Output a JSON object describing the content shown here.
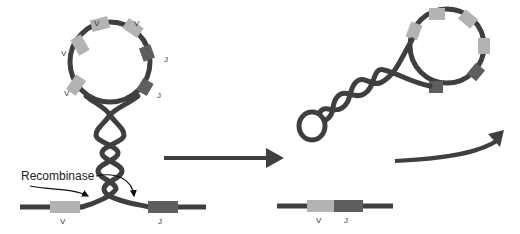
{
  "diagram": {
    "colors": {
      "dna": "#3f3f3f",
      "v_segment": "#b3b3b3",
      "j_segment": "#5e5e5e",
      "arrow": "#3f3f3f",
      "background": "#ffffff"
    },
    "left_panel": {
      "loop_segments": [
        {
          "type": "V",
          "label": "V"
        },
        {
          "type": "V",
          "label": "V"
        },
        {
          "type": "V",
          "label": "V"
        },
        {
          "type": "V",
          "label": "V"
        },
        {
          "type": "J",
          "label": "J"
        },
        {
          "type": "J",
          "label": "J"
        }
      ],
      "enzyme_label": "Recombinase",
      "bottom_segments": [
        {
          "type": "V",
          "label": "V"
        },
        {
          "type": "J",
          "label": "J"
        }
      ]
    },
    "transition_arrow": {
      "direction": "right"
    },
    "right_panel": {
      "excised_loop_segments": [
        {
          "type": "V"
        },
        {
          "type": "V"
        },
        {
          "type": "V"
        },
        {
          "type": "V"
        },
        {
          "type": "J"
        },
        {
          "type": "J"
        }
      ],
      "curved_arrow": {
        "direction": "up-right"
      },
      "joined_segments": [
        {
          "type": "V",
          "label": "V"
        },
        {
          "type": "J",
          "label": "J"
        }
      ]
    }
  }
}
